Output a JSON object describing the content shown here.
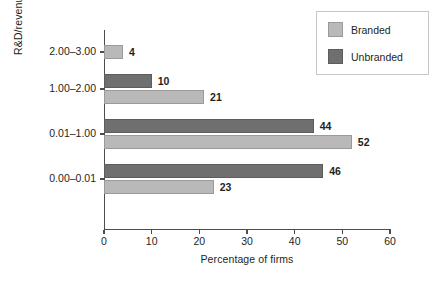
{
  "chart_data": {
    "type": "bar",
    "orientation": "horizontal",
    "title": "",
    "xlabel": "Percentage of firms",
    "ylabel": "R&D/revenue ratio (%)",
    "categories": [
      "0.00–0.01",
      "0.01–1.00",
      "1.00–2.00",
      "2.00–3.00"
    ],
    "series": [
      {
        "name": "Branded",
        "color": "#b9b9b9",
        "values": [
          23,
          52,
          21,
          4
        ]
      },
      {
        "name": "Unbranded",
        "color": "#6f6f6f",
        "values": [
          46,
          44,
          10,
          null
        ]
      }
    ],
    "xlim": [
      0,
      60
    ],
    "xticks": [
      0,
      10,
      20,
      30,
      40,
      50,
      60
    ],
    "grid": false,
    "legend_position": "top-right",
    "data_labels": [
      "4",
      "10",
      "21",
      "44",
      "52",
      "46",
      "23"
    ]
  },
  "axes": {
    "y_title": "R&D/revenue ratio (%)",
    "x_title": "Percentage of firms",
    "x_tick_labels": [
      "0",
      "10",
      "20",
      "30",
      "40",
      "50",
      "60"
    ],
    "y_tick_labels": [
      "2.00–3.00",
      "1.00–2.00",
      "0.01–1.00",
      "0.00–0.01"
    ]
  },
  "legend": {
    "items": [
      {
        "label": "Branded",
        "color": "#b9b9b9"
      },
      {
        "label": "Unbranded",
        "color": "#6f6f6f"
      }
    ]
  },
  "bars": [
    {
      "group": "2.00–3.00",
      "series": "Branded",
      "value": 4,
      "label": "4"
    },
    {
      "group": "1.00–2.00",
      "series": "Unbranded",
      "value": 10,
      "label": "10"
    },
    {
      "group": "1.00–2.00",
      "series": "Branded",
      "value": 21,
      "label": "21"
    },
    {
      "group": "0.01–1.00",
      "series": "Unbranded",
      "value": 44,
      "label": "44"
    },
    {
      "group": "0.01–1.00",
      "series": "Branded",
      "value": 52,
      "label": "52"
    },
    {
      "group": "0.00–0.01",
      "series": "Unbranded",
      "value": 46,
      "label": "46"
    },
    {
      "group": "0.00–0.01",
      "series": "Branded",
      "value": 23,
      "label": "23"
    }
  ]
}
